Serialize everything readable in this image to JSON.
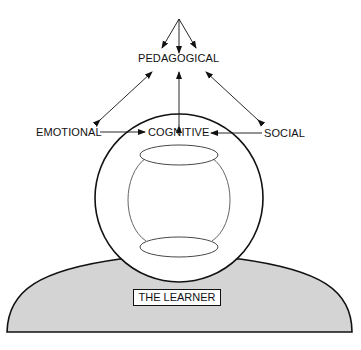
{
  "diagram": {
    "top_label": "PEDAGOGICAL",
    "left_label": "EMOTIONAL",
    "center_label": "COGNITIVE",
    "right_label": "SOCIAL",
    "figure_label": "THE LEARNER",
    "colors": {
      "line": "#111111",
      "body_fill": "#d4d4d4",
      "background": "#ffffff"
    }
  }
}
